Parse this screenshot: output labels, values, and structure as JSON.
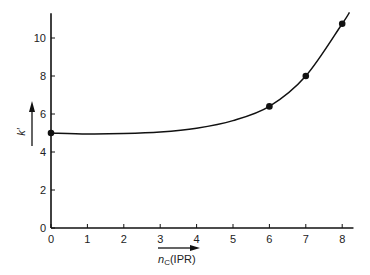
{
  "chart_data": {
    "type": "line",
    "title": "",
    "xlabel": "n_C (IPR)",
    "xlabel_main": "n",
    "xlabel_sub": "C",
    "xlabel_suffix": "(IPR)",
    "ylabel": "k′",
    "xlim": [
      0,
      8.2
    ],
    "ylim": [
      0,
      11.3
    ],
    "x_ticks": [
      0,
      1,
      2,
      3,
      4,
      5,
      6,
      7,
      8
    ],
    "y_ticks": [
      0,
      2,
      4,
      6,
      8,
      10
    ],
    "grid": false,
    "legend": null,
    "series": [
      {
        "name": "measured",
        "style": "markers",
        "x": [
          0,
          6,
          7,
          8
        ],
        "y": [
          5.0,
          6.4,
          8.0,
          10.75
        ]
      },
      {
        "name": "fit curve",
        "style": "line",
        "x": [
          0,
          1,
          2,
          3,
          4,
          5,
          6,
          7,
          8,
          8.2
        ],
        "y": [
          5.0,
          4.95,
          4.97,
          5.05,
          5.25,
          5.65,
          6.4,
          8.0,
          10.75,
          11.35
        ]
      }
    ],
    "colors": {
      "line": "#111111",
      "axis": "#111111",
      "text": "#222222"
    }
  }
}
